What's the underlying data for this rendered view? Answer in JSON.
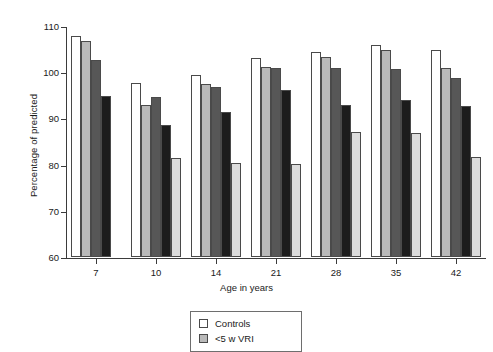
{
  "chart_data": {
    "type": "bar",
    "title": "",
    "xlabel": "Age in years",
    "ylabel": "Percentage of predicted",
    "categories": [
      "7",
      "10",
      "14",
      "21",
      "28",
      "35",
      "42"
    ],
    "ylim": [
      60,
      110
    ],
    "yticks": [
      60,
      70,
      80,
      90,
      100,
      110
    ],
    "grid": false,
    "legend_position": "bottom-center",
    "series": [
      {
        "name": "Controls",
        "color": "#ffffff",
        "values": [
          107.8,
          97.7,
          99.5,
          103.0,
          104.3,
          105.8,
          104.8
        ]
      },
      {
        "name": "<5 w VRI",
        "color": "#b9b9b9",
        "values": [
          106.8,
          92.8,
          97.5,
          101.2,
          103.2,
          104.8,
          100.9
        ]
      },
      {
        "name": "5-9 w VRI",
        "color": "#575757",
        "values": [
          102.6,
          94.7,
          96.8,
          101.0,
          100.9,
          100.8,
          98.7
        ]
      },
      {
        "name": ">=10 w VRI",
        "color": "#1c1c1c",
        "values": [
          94.9,
          88.6,
          91.4,
          96.2,
          92.9,
          93.9,
          92.6
        ]
      },
      {
        "name": "Severe VRI",
        "color": "#dcdcdc",
        "values": [
          null,
          81.4,
          80.3,
          80.1,
          87.1,
          86.9,
          81.7
        ]
      }
    ]
  },
  "legend": {
    "items": [
      {
        "label": "Controls",
        "color": "#ffffff"
      },
      {
        "label": "<5 w VRI",
        "color": "#b9b9b9"
      }
    ]
  }
}
